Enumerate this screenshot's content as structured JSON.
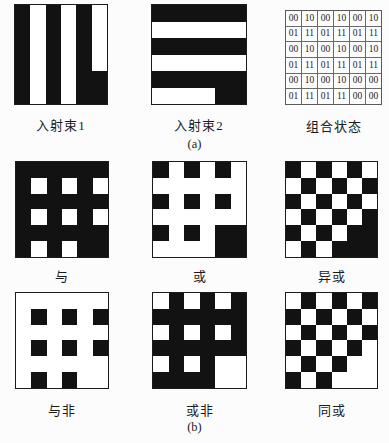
{
  "page": {
    "paper_color": "#fcfcfc",
    "ink_color": "#171717",
    "bit_on_color": "#ffffff",
    "bit_off_color": "#121212"
  },
  "panel_a": {
    "caption": "(a)",
    "beam1": {
      "label": "入射束1",
      "matrix": [
        "010101",
        "010101",
        "010101",
        "010101",
        "010100",
        "010100"
      ]
    },
    "beam2": {
      "label": "入射束2",
      "matrix": [
        "000000",
        "111111",
        "000000",
        "111111",
        "000000",
        "111100"
      ]
    },
    "combined_state": {
      "label": "组合状态",
      "rows": [
        [
          "00",
          "10",
          "00",
          "10",
          "00",
          "10"
        ],
        [
          "01",
          "11",
          "01",
          "11",
          "01",
          "11"
        ],
        [
          "00",
          "10",
          "00",
          "10",
          "00",
          "10"
        ],
        [
          "01",
          "11",
          "01",
          "11",
          "01",
          "11"
        ],
        [
          "00",
          "10",
          "00",
          "10",
          "00",
          "00"
        ],
        [
          "01",
          "11",
          "01",
          "11",
          "00",
          "00"
        ]
      ]
    }
  },
  "panel_b": {
    "caption": "(b)",
    "and": {
      "label": "与",
      "matrix": [
        "000000",
        "010101",
        "000000",
        "010101",
        "000000",
        "010100"
      ]
    },
    "or": {
      "label": "或",
      "matrix": [
        "010101",
        "111111",
        "010101",
        "111111",
        "010100",
        "111100"
      ]
    },
    "xor": {
      "label": "异或",
      "matrix": [
        "010101",
        "101010",
        "010101",
        "101010",
        "010100",
        "101000"
      ]
    },
    "nand": {
      "label": "与非",
      "matrix": [
        "111111",
        "101010",
        "111111",
        "101010",
        "111111",
        "101011"
      ]
    },
    "nor": {
      "label": "或非",
      "matrix": [
        "101010",
        "000000",
        "101010",
        "000000",
        "101011",
        "000011"
      ]
    },
    "xnor": {
      "label": "同或",
      "matrix": [
        "101010",
        "010101",
        "101010",
        "010101",
        "101011",
        "010111"
      ]
    }
  }
}
